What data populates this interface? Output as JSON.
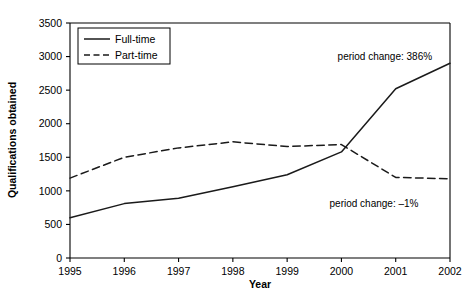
{
  "chart_data": {
    "type": "line",
    "title": "",
    "xlabel": "Year",
    "ylabel": "Qualifications obtained",
    "categories": [
      "1995",
      "1996",
      "1997",
      "1998",
      "1999",
      "2000",
      "2001",
      "2002"
    ],
    "x": [
      1995,
      1996,
      1997,
      1998,
      1999,
      2000,
      2001,
      2002
    ],
    "xlim": [
      1995,
      2002
    ],
    "ylim": [
      0,
      3500
    ],
    "yticks": [
      0,
      500,
      1000,
      1500,
      2000,
      2500,
      3000,
      3500
    ],
    "ytick_labels": [
      "0",
      "500",
      "1000",
      "1500",
      "2000",
      "2500",
      "3000",
      "3500"
    ],
    "grid": false,
    "legend_position": "top-left",
    "series": [
      {
        "name": "Full-time",
        "style": "solid",
        "color": "#1a1a1a",
        "values": [
          600,
          810,
          890,
          1060,
          1240,
          1580,
          2520,
          2900
        ]
      },
      {
        "name": "Part-time",
        "style": "dashed",
        "color": "#1a1a1a",
        "values": [
          1190,
          1500,
          1640,
          1730,
          1660,
          1690,
          1200,
          1180
        ]
      }
    ],
    "annotations": [
      {
        "text": "period change: 386%",
        "series": "Full-time",
        "x": 2000.8,
        "y": 2950
      },
      {
        "text": "period change: –1%",
        "series": "Part-time",
        "x": 2000.6,
        "y": 760
      }
    ]
  },
  "legend": {
    "items": [
      {
        "label": "Full-time",
        "style": "solid"
      },
      {
        "label": "Part-time",
        "style": "dashed"
      }
    ]
  },
  "axes": {
    "x_title": "Year",
    "y_title": "Qualifications obtained"
  }
}
